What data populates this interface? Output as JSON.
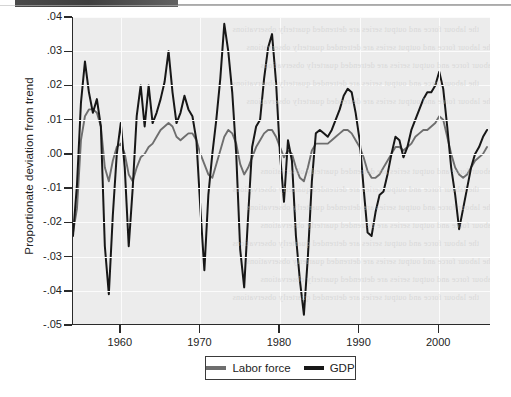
{
  "figure": {
    "ylabel": "Proportionate deviation from trend",
    "plot_bg": "#ececec",
    "gridline_color": "#ffffff"
  },
  "legend": {
    "items": [
      {
        "label": "Labor force",
        "color": "#6e6e6e",
        "swatch": "line-swatch"
      },
      {
        "label": "GDP",
        "color": "#171717",
        "swatch": "line-swatch"
      }
    ]
  },
  "chart_data": {
    "type": "line",
    "title": "",
    "xlabel": "",
    "ylabel": "Proportionate deviation from trend",
    "xlim": [
      1954.0,
      2006.5
    ],
    "ylim": [
      -0.05,
      0.04
    ],
    "ytick_labels": [
      ".04",
      ".03",
      ".02",
      ".01",
      ".00",
      "-.01",
      "-.02",
      "-.03",
      "-.04",
      "-.05"
    ],
    "ytick_values": [
      0.04,
      0.03,
      0.02,
      0.01,
      0.0,
      -0.01,
      -0.02,
      -0.03,
      -0.04,
      -0.05
    ],
    "xtick_labels": [
      "1960",
      "1970",
      "1980",
      "1990",
      "2000"
    ],
    "xtick_values": [
      1960,
      1970,
      1980,
      1990,
      2000
    ],
    "grid": true,
    "grid_axes": "both",
    "legend_position": "below-center",
    "series": [
      {
        "name": "Labor force",
        "color": "#6e6e6e",
        "x": [
          1954.0,
          1954.5,
          1955.0,
          1955.5,
          1956.0,
          1956.5,
          1957.0,
          1957.5,
          1958.0,
          1958.5,
          1959.0,
          1959.5,
          1960.0,
          1960.5,
          1961.0,
          1961.5,
          1962.0,
          1962.5,
          1963.0,
          1963.5,
          1964.0,
          1964.5,
          1965.0,
          1965.5,
          1966.0,
          1966.5,
          1967.0,
          1967.5,
          1968.0,
          1968.5,
          1969.0,
          1969.5,
          1970.0,
          1970.5,
          1971.0,
          1971.5,
          1972.0,
          1972.5,
          1973.0,
          1973.5,
          1974.0,
          1974.5,
          1975.0,
          1975.5,
          1976.0,
          1976.5,
          1977.0,
          1977.5,
          1978.0,
          1978.5,
          1979.0,
          1979.5,
          1980.0,
          1980.5,
          1981.0,
          1981.5,
          1982.0,
          1982.5,
          1983.0,
          1983.5,
          1984.0,
          1984.5,
          1985.0,
          1985.5,
          1986.0,
          1986.5,
          1987.0,
          1987.5,
          1988.0,
          1988.5,
          1989.0,
          1989.5,
          1990.0,
          1990.5,
          1991.0,
          1991.5,
          1992.0,
          1992.5,
          1993.0,
          1993.5,
          1994.0,
          1994.5,
          1995.0,
          1995.5,
          1996.0,
          1996.5,
          1997.0,
          1997.5,
          1998.0,
          1998.5,
          1999.0,
          1999.5,
          2000.0,
          2000.5,
          2001.0,
          2001.5,
          2002.0,
          2002.5,
          2003.0,
          2003.5,
          2004.0,
          2004.5,
          2005.0,
          2005.5,
          2006.0
        ],
        "values": [
          -0.023,
          -0.016,
          0.004,
          0.011,
          0.013,
          0.013,
          0.012,
          0.008,
          -0.004,
          -0.008,
          -0.002,
          0.002,
          0.003,
          0.0,
          -0.006,
          -0.008,
          -0.004,
          -0.001,
          0.0,
          0.002,
          0.003,
          0.005,
          0.007,
          0.008,
          0.009,
          0.008,
          0.005,
          0.004,
          0.005,
          0.006,
          0.006,
          0.004,
          0.0,
          -0.003,
          -0.006,
          -0.007,
          -0.003,
          0.001,
          0.005,
          0.007,
          0.006,
          0.003,
          -0.003,
          -0.006,
          -0.004,
          -0.001,
          0.002,
          0.004,
          0.006,
          0.007,
          0.007,
          0.005,
          0.002,
          -0.001,
          0.001,
          0.0,
          -0.004,
          -0.007,
          -0.008,
          -0.004,
          0.001,
          0.003,
          0.003,
          0.003,
          0.003,
          0.004,
          0.005,
          0.006,
          0.007,
          0.007,
          0.006,
          0.004,
          0.002,
          -0.001,
          -0.005,
          -0.007,
          -0.007,
          -0.006,
          -0.004,
          -0.002,
          0.0,
          0.002,
          0.002,
          0.001,
          0.002,
          0.003,
          0.005,
          0.006,
          0.007,
          0.007,
          0.008,
          0.009,
          0.011,
          0.01,
          0.005,
          0.0,
          -0.004,
          -0.006,
          -0.007,
          -0.006,
          -0.004,
          -0.002,
          -0.001,
          0.0,
          0.002
        ]
      },
      {
        "name": "GDP",
        "color": "#171717",
        "x": [
          1954.0,
          1954.5,
          1955.0,
          1955.5,
          1956.0,
          1956.5,
          1957.0,
          1957.5,
          1958.0,
          1958.5,
          1959.0,
          1959.5,
          1960.0,
          1960.5,
          1961.0,
          1961.5,
          1962.0,
          1962.5,
          1963.0,
          1963.5,
          1964.0,
          1964.5,
          1965.0,
          1965.5,
          1966.0,
          1966.5,
          1967.0,
          1967.5,
          1968.0,
          1968.5,
          1969.0,
          1969.5,
          1970.0,
          1970.5,
          1971.0,
          1971.5,
          1972.0,
          1972.5,
          1973.0,
          1973.5,
          1974.0,
          1974.5,
          1975.0,
          1975.5,
          1976.0,
          1976.5,
          1977.0,
          1977.5,
          1978.0,
          1978.5,
          1979.0,
          1979.5,
          1980.0,
          1980.5,
          1981.0,
          1981.5,
          1982.0,
          1982.5,
          1983.0,
          1983.5,
          1984.0,
          1984.5,
          1985.0,
          1985.5,
          1986.0,
          1986.5,
          1987.0,
          1987.5,
          1988.0,
          1988.5,
          1989.0,
          1989.5,
          1990.0,
          1990.5,
          1991.0,
          1991.5,
          1992.0,
          1992.5,
          1993.0,
          1993.5,
          1994.0,
          1994.5,
          1995.0,
          1995.5,
          1996.0,
          1996.5,
          1997.0,
          1997.5,
          1998.0,
          1998.5,
          1999.0,
          1999.5,
          2000.0,
          2000.5,
          2001.0,
          2001.5,
          2002.0,
          2002.5,
          2003.0,
          2003.5,
          2004.0,
          2004.5,
          2005.0,
          2005.5,
          2006.0
        ],
        "values": [
          -0.024,
          -0.009,
          0.015,
          0.027,
          0.018,
          0.012,
          0.016,
          0.008,
          -0.027,
          -0.041,
          -0.018,
          0.0,
          0.009,
          -0.004,
          -0.027,
          -0.01,
          0.011,
          0.02,
          0.008,
          0.02,
          0.009,
          0.012,
          0.016,
          0.021,
          0.03,
          0.018,
          0.009,
          0.012,
          0.017,
          0.013,
          0.011,
          0.004,
          -0.016,
          -0.034,
          -0.012,
          0.0,
          0.01,
          0.022,
          0.038,
          0.03,
          0.018,
          0.0,
          -0.028,
          -0.039,
          -0.018,
          0.002,
          0.008,
          0.01,
          0.022,
          0.031,
          0.035,
          0.021,
          0.0,
          -0.014,
          0.004,
          -0.002,
          -0.024,
          -0.037,
          -0.047,
          -0.03,
          -0.008,
          0.006,
          0.007,
          0.006,
          0.005,
          0.007,
          0.01,
          0.013,
          0.017,
          0.019,
          0.018,
          0.012,
          0.004,
          -0.01,
          -0.023,
          -0.024,
          -0.017,
          -0.012,
          -0.011,
          -0.006,
          0.0,
          0.005,
          0.004,
          -0.001,
          0.002,
          0.007,
          0.01,
          0.013,
          0.016,
          0.018,
          0.018,
          0.02,
          0.024,
          0.019,
          0.008,
          -0.004,
          -0.012,
          -0.022,
          -0.016,
          -0.01,
          -0.004,
          0.0,
          0.002,
          0.005,
          0.007
        ]
      }
    ]
  }
}
